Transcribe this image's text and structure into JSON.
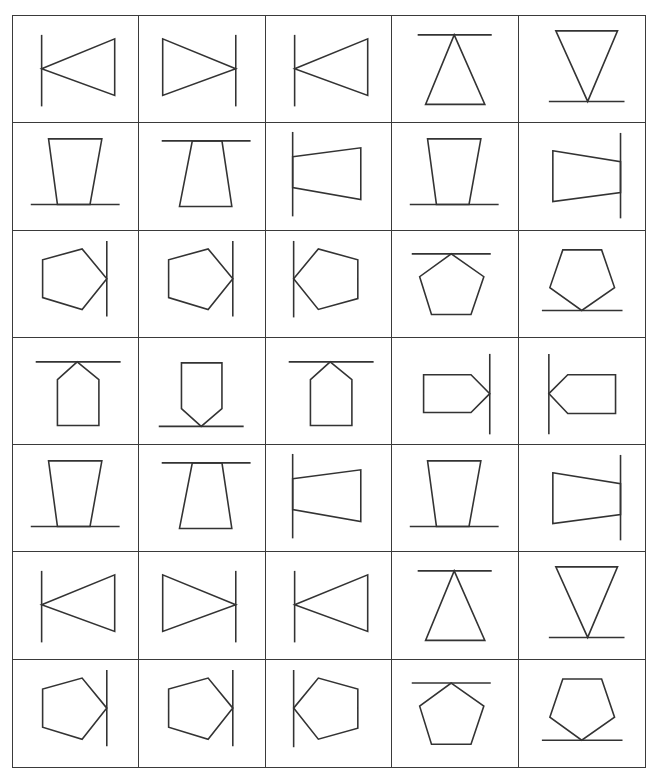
{
  "grid": {
    "columns": 5,
    "rows": 7,
    "cell_size": [
      127,
      107.5
    ],
    "stroke_color": "#333333"
  },
  "shapes": {
    "tri-left-line": {
      "polygon": "29,53 103,23 103,80",
      "line": [
        29,
        19,
        29,
        91
      ]
    },
    "tri-right-line": {
      "polygon": "98,53 24,23 24,80",
      "line": [
        98,
        19,
        98,
        91
      ]
    },
    "tri-top-line": {
      "polygon": "63,19 34,89 94,89",
      "line": [
        26,
        19,
        101,
        19
      ]
    },
    "tri-bottom-line": {
      "polygon": "37,15 99,15 69,86",
      "line": [
        30,
        86,
        106,
        86
      ]
    },
    "trap-bottom-line": {
      "polygon": "36,16 90,16 78,82 45,82",
      "line": [
        18,
        82,
        108,
        82
      ]
    },
    "trap-top-line": {
      "polygon": "54,18 84,18 94,84 41,84",
      "line": [
        23,
        18,
        113,
        18
      ]
    },
    "trap-left-line": {
      "polygon": "27,34 96,25 96,77 27,65",
      "line": [
        27,
        9,
        27,
        94
      ]
    },
    "trap-right-line": {
      "polygon": "34,28 102,39 102,70 34,79",
      "line": [
        102,
        10,
        102,
        96
      ]
    },
    "pent-right-line": {
      "polygon": "95,48 70,18 30,29 30,67 70,79",
      "line": [
        95,
        10,
        95,
        86
      ]
    },
    "pent-left-line": {
      "polygon": "28,48 53,18 93,29 93,68 53,79",
      "line": [
        28,
        10,
        28,
        87
      ]
    },
    "pent-top-line": {
      "polygon": "60,23 93,46 80,84 40,84 28,46",
      "line": [
        20,
        23,
        100,
        23
      ]
    },
    "pent-bottom-line": {
      "polygon": "44,19 83,19 96,57 63,80 31,57",
      "line": [
        23,
        80,
        104,
        80
      ]
    },
    "house-top-line": {
      "polygon": "65,24 87,42 87,88 45,88 45,42",
      "line": [
        23,
        24,
        109,
        24
      ]
    },
    "house-bottom-line": {
      "polygon": "43,25 84,25 84,71 63,89 43,71",
      "line": [
        20,
        89,
        106,
        89
      ]
    },
    "arrow-right-line": {
      "polygon": "32,37 80,37 99,56 80,75 32,75",
      "line": [
        99,
        16,
        99,
        97
      ]
    },
    "arrow-left-line": {
      "polygon": "30,56 49,37 97,37 97,76 49,76",
      "line": [
        30,
        16,
        30,
        97
      ]
    }
  },
  "cells": [
    [
      "tri-left-line",
      "tri-right-line",
      "tri-left-line",
      "tri-top-line",
      "tri-bottom-line"
    ],
    [
      "trap-bottom-line",
      "trap-top-line",
      "trap-left-line",
      "trap-bottom-line",
      "trap-right-line"
    ],
    [
      "pent-right-line",
      "pent-right-line",
      "pent-left-line",
      "pent-top-line",
      "pent-bottom-line"
    ],
    [
      "house-top-line",
      "house-bottom-line",
      "house-top-line",
      "arrow-right-line",
      "arrow-left-line"
    ],
    [
      "trap-bottom-line",
      "trap-top-line",
      "trap-left-line",
      "trap-bottom-line",
      "trap-right-line"
    ],
    [
      "tri-left-line",
      "tri-right-line",
      "tri-left-line",
      "tri-top-line",
      "tri-bottom-line"
    ],
    [
      "pent-right-line",
      "pent-right-line",
      "pent-left-line",
      "pent-top-line",
      "pent-bottom-line"
    ]
  ]
}
